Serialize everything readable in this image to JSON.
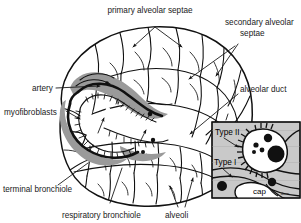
{
  "figure": {
    "background_color": "#ffffff",
    "ink_color": "#111111",
    "shade_color": "#9a9a9a",
    "inset_background_color": "#c9c9c9"
  },
  "labels": {
    "primary_alveolar_septae": "primary alveolar septae",
    "secondary_alveolar_line1": "secondary alveolar",
    "secondary_alveolar_line2": "septae",
    "alveolar_duct": "alveolar duct",
    "artery": "artery",
    "myofibroblasts": "myofibroblasts",
    "terminal_bronchiole": "terminal bronchiole",
    "respiratory_bronchiole": "respiratory bronchiole",
    "alveoli": "alveoli"
  },
  "inset": {
    "type_ii": "Type II",
    "type_i": "Type I",
    "cap": "cap",
    "signature": "dwm"
  }
}
